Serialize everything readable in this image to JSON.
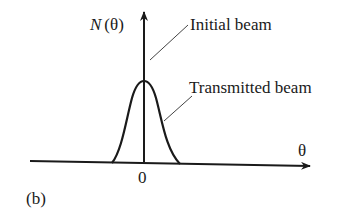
{
  "figure": {
    "panel_label": "(b)",
    "y_axis_label_var": "N",
    "y_axis_label_arg": "(θ)",
    "x_axis_label": "θ",
    "x_tick_label": "0",
    "annotations": {
      "initial": "Initial beam",
      "transmitted": "Transmitted beam"
    },
    "colors": {
      "ink": "#1a1a1a",
      "leader": "#444444",
      "background": "#ffffff"
    }
  }
}
